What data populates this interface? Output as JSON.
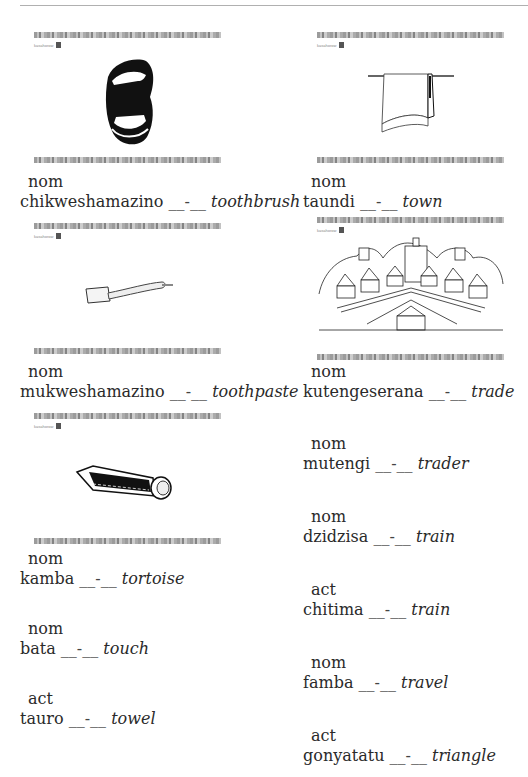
{
  "header": {
    "text": ""
  },
  "brand_label": "kasahorow",
  "left_column": {
    "cards": [
      {
        "image": "mouth-icon",
        "pos": "nom",
        "word": "chikweshamazino",
        "blank": "__-__",
        "english": "toothbrush"
      },
      {
        "image": "toothbrush-icon",
        "pos": "nom",
        "word": "mukweshamazino",
        "blank": "__-__",
        "english": "toothpaste"
      },
      {
        "image": "toothpaste-icon",
        "pos": "nom",
        "word": "kamba",
        "blank": "__-__",
        "english": "tortoise"
      }
    ],
    "entries": [
      {
        "pos": "nom",
        "word": "bata",
        "blank": "__-__",
        "english": "touch"
      },
      {
        "pos": "act",
        "word": "tauro",
        "blank": "__-__",
        "english": "towel"
      }
    ]
  },
  "right_column": {
    "cards": [
      {
        "image": "towel-icon",
        "pos": "nom",
        "word": "taundi",
        "blank": "__-__",
        "english": "town"
      },
      {
        "image": "town-icon",
        "pos": "nom",
        "word": "kutengeserana",
        "blank": "__-__",
        "english": "trade"
      }
    ],
    "entries": [
      {
        "pos": "nom",
        "word": "mutengi",
        "blank": "__-__",
        "english": "trader"
      },
      {
        "pos": "nom",
        "word": "dzidzisa",
        "blank": "__-__",
        "english": "train"
      },
      {
        "pos": "act",
        "word": "chitima",
        "blank": "__-__",
        "english": "train"
      },
      {
        "pos": "nom",
        "word": "famba",
        "blank": "__-__",
        "english": "travel"
      },
      {
        "pos": "act",
        "word": "gonyatatu",
        "blank": "__-__",
        "english": "triangle"
      }
    ]
  }
}
